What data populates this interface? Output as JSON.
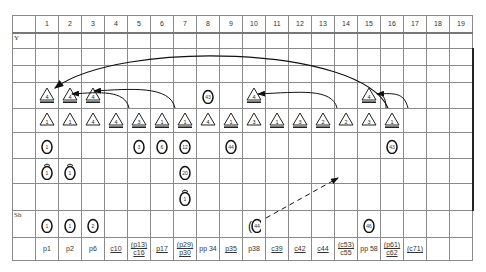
{
  "columns": [
    "1",
    "2",
    "3",
    "4",
    "5",
    "6",
    "7",
    "8",
    "9",
    "10",
    "11",
    "12",
    "13",
    "14",
    "15",
    "16",
    "17",
    "18",
    "19"
  ],
  "row_labels": [
    "",
    "Y",
    "",
    "",
    "",
    "",
    "",
    "",
    "",
    "Sh",
    ""
  ],
  "triangle_row_1": [
    {
      "col": 1,
      "num": "4",
      "bar": true
    },
    {
      "col": 2,
      "num": "4",
      "bar": true
    },
    {
      "col": 3,
      "num": "4",
      "bar": true
    },
    {
      "col": 10,
      "num": "4",
      "bar": true
    },
    {
      "col": 15,
      "num": "4",
      "bar": true
    }
  ],
  "circle_row_1": [
    {
      "col": 8,
      "num": "43"
    }
  ],
  "triangle_row_2": [
    {
      "col": 1,
      "num": "1",
      "bar": false
    },
    {
      "col": 2,
      "num": "1",
      "bar": false
    },
    {
      "col": 3,
      "num": "4",
      "bar": false
    },
    {
      "col": 4,
      "num": "4",
      "bar": true
    },
    {
      "col": 5,
      "num": "3",
      "bar": true
    },
    {
      "col": 6,
      "num": "1",
      "bar": true
    },
    {
      "col": 7,
      "num": "1",
      "bar": true
    },
    {
      "col": 8,
      "num": "4",
      "bar": false
    },
    {
      "col": 9,
      "num": "1",
      "bar": true
    },
    {
      "col": 10,
      "num": "3",
      "bar": false
    },
    {
      "col": 11,
      "num": "1",
      "bar": true
    },
    {
      "col": 12,
      "num": "3",
      "bar": true
    },
    {
      "col": 13,
      "num": "2",
      "bar": true
    },
    {
      "col": 14,
      "num": "2",
      "bar": false
    },
    {
      "col": 15,
      "num": "3",
      "bar": false
    },
    {
      "col": 16,
      "num": "1",
      "bar": true
    }
  ],
  "circle_row_2": [
    {
      "col": 1,
      "num": "1"
    },
    {
      "col": 5,
      "num": "3"
    },
    {
      "col": 6,
      "num": "6"
    },
    {
      "col": 7,
      "num": "12"
    },
    {
      "col": 9,
      "num": "44"
    },
    {
      "col": 16,
      "num": "43"
    }
  ],
  "circle_row_3": [
    {
      "col": 1,
      "num": "1",
      "hat": true
    },
    {
      "col": 2,
      "num": "1",
      "hat": true
    },
    {
      "col": 7,
      "num": "20",
      "hat": false
    }
  ],
  "circle_row_4": [
    {
      "col": 7,
      "num": "1",
      "hat": true
    }
  ],
  "sh_row": [
    {
      "col": 1,
      "num": "1"
    },
    {
      "col": 2,
      "num": "1"
    },
    {
      "col": 3,
      "num": "2"
    },
    {
      "col": 10,
      "num": "44",
      "paren": true
    },
    {
      "col": 15,
      "num": "46"
    }
  ],
  "footer": [
    {
      "line1": "p1",
      "line2": "",
      "u1": false,
      "u2": false
    },
    {
      "line1": "p2",
      "line2": "",
      "u1": false,
      "u2": false
    },
    {
      "line1": "p6",
      "line2": "",
      "u1": false,
      "u2": false
    },
    {
      "line1": "c10",
      "line2": "",
      "u1": true,
      "u2": false
    },
    {
      "line1": "(p13)",
      "line2": "c16",
      "u1": true,
      "u2": true
    },
    {
      "line1": "p17",
      "line2": "",
      "u1": true,
      "u2": false
    },
    {
      "line1": "(p29)",
      "line2": "p30",
      "u1": true,
      "u2": true
    },
    {
      "line1": "pp 34",
      "line2": "",
      "u1": false,
      "u2": false
    },
    {
      "line1": "p35",
      "line2": "",
      "u1": true,
      "u2": false
    },
    {
      "line1": "p38",
      "line2": "",
      "u1": false,
      "u2": false
    },
    {
      "line1": "c39",
      "line2": "",
      "u1": true,
      "u2": false
    },
    {
      "line1": "c42",
      "line2": "",
      "u1": true,
      "u2": false
    },
    {
      "line1": "c44",
      "line2": "",
      "u1": true,
      "u2": false
    },
    {
      "line1": "(c53)",
      "line2": "c55",
      "u1": true,
      "u2": false
    },
    {
      "line1": "pp 58",
      "line2": "",
      "u1": false,
      "u2": false
    },
    {
      "line1": "(p61)",
      "line2": "c62",
      "u1": true,
      "u2": true
    },
    {
      "line1": "(c71)",
      "line2": "",
      "u1": true,
      "u2": false
    },
    {
      "line1": "",
      "line2": "",
      "u1": false,
      "u2": false
    },
    {
      "line1": "",
      "line2": "",
      "u1": false,
      "u2": false
    }
  ],
  "arrows": [
    {
      "from_col": 15,
      "to_col": 1,
      "style": "solid",
      "desc": "long arc from col 15 triangle to col 1 triangle"
    },
    {
      "from_col": 5,
      "to_col": 2,
      "style": "solid"
    },
    {
      "from_col": 7,
      "to_col": 3,
      "style": "solid"
    },
    {
      "from_col": 14,
      "to_col": 10,
      "style": "solid"
    },
    {
      "from_col": 16,
      "to_col": 15,
      "style": "solid"
    },
    {
      "from_col": 15,
      "to_col": 15,
      "style": "solid"
    },
    {
      "from_col": 10,
      "to_col": 14,
      "style": "dashed",
      "desc": "dashed arrow from Sh col 10 up-right toward col 14"
    }
  ]
}
